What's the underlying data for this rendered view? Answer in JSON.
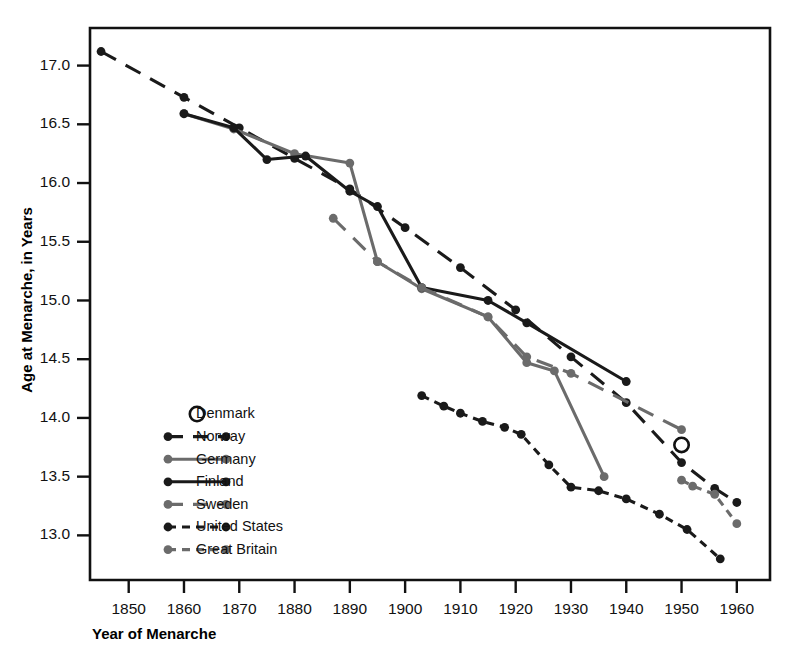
{
  "chart_data": {
    "type": "line",
    "title": "",
    "xlabel": "Year of Menarche",
    "ylabel": "Age at Menarche, in Years",
    "xlim": [
      1843,
      1966
    ],
    "ylim": [
      12.62,
      17.32
    ],
    "xticks": [
      1850,
      1860,
      1870,
      1880,
      1890,
      1900,
      1910,
      1920,
      1930,
      1940,
      1950,
      1960
    ],
    "xtick_labels": [
      "1850",
      "1860",
      "1870",
      "1880",
      "1890",
      "1900",
      "1910",
      "1920",
      "1930",
      "1940",
      "1950",
      "1960"
    ],
    "yticks": [
      13.0,
      13.5,
      14.0,
      14.5,
      15.0,
      15.5,
      16.0,
      16.5,
      17.0
    ],
    "ytick_labels": [
      "13.0",
      "13.5",
      "14.0",
      "14.5",
      "15.0",
      "15.5",
      "16.0",
      "16.5",
      "17.0"
    ],
    "grid": false,
    "legend_position": "inside-lower-left",
    "series": [
      {
        "name": "Denmark",
        "style": "marker-only",
        "marker": "open-circle",
        "color": "#1a1a1a",
        "x": [
          1950
        ],
        "y": [
          13.77
        ]
      },
      {
        "name": "Norway",
        "style": "long-dash",
        "marker": "filled-circle",
        "color": "#1a1a1a",
        "x": [
          1845,
          1860,
          1870,
          1880,
          1890,
          1900,
          1910,
          1920,
          1930,
          1940,
          1950,
          1956,
          1960
        ],
        "y": [
          17.12,
          16.73,
          16.47,
          16.21,
          15.95,
          15.62,
          15.28,
          14.92,
          14.52,
          14.13,
          13.62,
          13.4,
          13.28
        ]
      },
      {
        "name": "Germany",
        "style": "solid",
        "marker": "filled-circle",
        "color": "#6b6b6b",
        "x": [
          1860,
          1869,
          1880,
          1890,
          1895,
          1903,
          1915,
          1922,
          1927,
          1936
        ],
        "y": [
          16.59,
          16.46,
          16.25,
          16.17,
          15.33,
          15.1,
          14.86,
          14.47,
          14.4,
          13.5
        ]
      },
      {
        "name": "Finland",
        "style": "solid",
        "marker": "filled-circle",
        "color": "#1a1a1a",
        "x": [
          1860,
          1869,
          1875,
          1882,
          1890,
          1895,
          1903,
          1915,
          1922,
          1940
        ],
        "y": [
          16.59,
          16.47,
          16.2,
          16.23,
          15.93,
          15.8,
          15.11,
          15.0,
          14.81,
          14.31
        ]
      },
      {
        "name": "Sweden",
        "style": "long-dash",
        "marker": "filled-circle",
        "color": "#6b6b6b",
        "x": [
          1887,
          1895,
          1903,
          1915,
          1922,
          1930,
          1950
        ],
        "y": [
          15.7,
          15.33,
          15.11,
          14.86,
          14.52,
          14.38,
          13.9
        ]
      },
      {
        "name": "United States",
        "style": "dashed",
        "marker": "filled-circle",
        "color": "#1a1a1a",
        "x": [
          1903,
          1907,
          1910,
          1914,
          1918,
          1921,
          1926,
          1930,
          1935,
          1940,
          1946,
          1951,
          1957
        ],
        "y": [
          14.19,
          14.1,
          14.04,
          13.97,
          13.92,
          13.86,
          13.6,
          13.41,
          13.38,
          13.31,
          13.18,
          13.05,
          12.8
        ]
      },
      {
        "name": "Great Britain",
        "style": "dashed",
        "marker": "filled-circle",
        "color": "#6b6b6b",
        "x": [
          1950,
          1952,
          1956,
          1960
        ],
        "y": [
          13.47,
          13.42,
          13.35,
          13.1
        ]
      }
    ]
  },
  "axes": {
    "ylabel": "Age at Menarche, in Years",
    "xlabel": "Year of Menarche",
    "ytick_labels": [
      "17.0",
      "16.5",
      "16.0",
      "15.5",
      "15.0",
      "14.5",
      "14.0",
      "13.5",
      "13.0"
    ],
    "xtick_labels": [
      "1850",
      "1860",
      "1870",
      "1880",
      "1890",
      "1900",
      "1910",
      "1920",
      "1930",
      "1940",
      "1950",
      "1960"
    ]
  },
  "legend": {
    "items": [
      {
        "label": "Denmark",
        "swatch": "open-circle-marker",
        "color": "#1a1a1a"
      },
      {
        "label": "Norway",
        "swatch": "long-dash-line",
        "color": "#1a1a1a"
      },
      {
        "label": "Germany",
        "swatch": "solid-line",
        "color": "#6b6b6b"
      },
      {
        "label": "Finland",
        "swatch": "solid-line",
        "color": "#1a1a1a"
      },
      {
        "label": "Sweden",
        "swatch": "long-dash-line",
        "color": "#6b6b6b"
      },
      {
        "label": "United States",
        "swatch": "dashed-line",
        "color": "#1a1a1a"
      },
      {
        "label": "Great Britain",
        "swatch": "dashed-line",
        "color": "#6b6b6b"
      }
    ]
  },
  "colors": {
    "dark": "#1a1a1a",
    "gray": "#6b6b6b",
    "frame": "#111111",
    "background": "#ffffff"
  }
}
